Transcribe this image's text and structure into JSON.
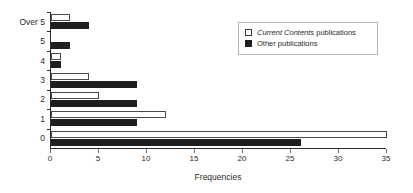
{
  "chart_data": {
    "type": "bar",
    "orientation": "horizontal",
    "title": "",
    "xlabel": "Frequencies",
    "ylabel": "",
    "categories": [
      "0",
      "1",
      "2",
      "3",
      "4",
      "5",
      "Over 5"
    ],
    "series": [
      {
        "name": "Current Contents publications",
        "name_italic_part": "Current Contents",
        "name_plain_part": " publications",
        "color": "#ffffff",
        "edge_color": "#4a4a4a",
        "values": [
          35,
          12,
          5,
          4,
          1,
          0,
          2
        ]
      },
      {
        "name": "Other publications",
        "color": "#1f1f1f",
        "edge_color": "#1f1f1f",
        "values": [
          26,
          9,
          9,
          9,
          1,
          2,
          4
        ]
      }
    ],
    "xlim": [
      0,
      35
    ],
    "xticks": [
      0,
      5,
      10,
      15,
      20,
      25,
      30,
      35
    ],
    "xtick_labels": [
      "0",
      "5",
      "10",
      "15",
      "20",
      "25",
      "30",
      "35"
    ],
    "grid": false,
    "legend_position": "top-right"
  },
  "legend": {
    "items": [
      {
        "italic": "Current Contents",
        "plain": " publications",
        "swatch": "open-square-swatch"
      },
      {
        "italic": "",
        "plain": "Other publications",
        "swatch": "filled-square-swatch"
      }
    ]
  },
  "axis": {
    "x_title": "Frequencies"
  }
}
